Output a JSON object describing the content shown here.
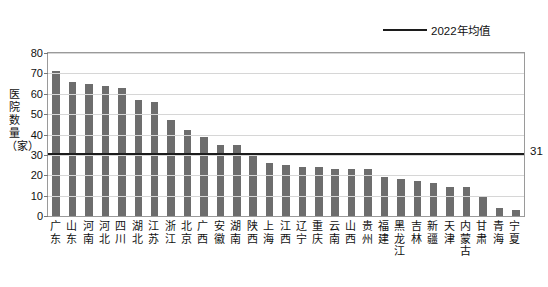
{
  "legend": {
    "label": "2022年均值"
  },
  "axis": {
    "ylabel": "医院数量（家）",
    "yticks": [
      "0",
      "10",
      "20",
      "30",
      "40",
      "50",
      "60",
      "70",
      "80"
    ]
  },
  "average": {
    "value": "31"
  },
  "chart_data": {
    "type": "bar",
    "title": "",
    "xlabel": "",
    "ylabel": "医院数量（家）",
    "ylim": [
      0,
      80
    ],
    "ytick_step": 10,
    "grid": true,
    "legend": [
      "2022年均值"
    ],
    "legend_position": "top-right",
    "average_line": 31,
    "average_label": "31",
    "categories": [
      "广东",
      "山东",
      "河南",
      "河北",
      "四川",
      "湖北",
      "江苏",
      "浙江",
      "北京",
      "广西",
      "安徽",
      "湖南",
      "陕西",
      "上海",
      "江西",
      "辽宁",
      "重庆",
      "云南",
      "山西",
      "贵州",
      "福建",
      "黑龙江",
      "吉林",
      "新疆",
      "天津",
      "内蒙古",
      "甘肃",
      "青海",
      "宁夏"
    ],
    "values": [
      71,
      66,
      65,
      64,
      63,
      57,
      56,
      47,
      42,
      39,
      35,
      35,
      30,
      26,
      25,
      24,
      24,
      23,
      23,
      23,
      19,
      18,
      17,
      16,
      14,
      14,
      10,
      4,
      3
    ]
  }
}
